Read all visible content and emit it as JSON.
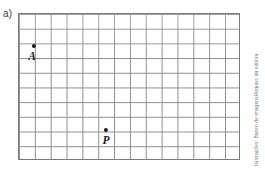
{
  "figure": {
    "item_label": "a)",
    "credit": "Ilustrações: Banco de imagens/Arquivo da editora",
    "grid": {
      "columns": 14,
      "rows": 10,
      "line_color": "#8f8f8f",
      "border_color": "#7c7c7c",
      "background_color": "#ffffff"
    },
    "points": [
      {
        "id": "A",
        "label": "A",
        "grid_col": 1,
        "grid_row": 3,
        "x_px": 33,
        "y_px": 45,
        "label_x_px": 31,
        "label_y_px": 49,
        "color": "#1b1b1b"
      },
      {
        "id": "P",
        "label": "P",
        "grid_col": 8,
        "grid_row": 8,
        "x_px": 105,
        "y_px": 129,
        "label_x_px": 105,
        "label_y_px": 133,
        "color": "#1b1b1b"
      }
    ]
  }
}
